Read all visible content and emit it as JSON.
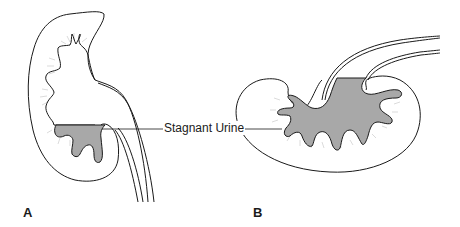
{
  "figure": {
    "type": "medical illustration",
    "callout_label": "Stagnant Urine",
    "panels": [
      {
        "id": "A",
        "label": "A",
        "description": "Kidney in upright orientation; stagnant urine pooled in lower calyces"
      },
      {
        "id": "B",
        "label": "B",
        "description": "Kidney in horizontal orientation; stagnant urine filling most of the pelvis and calyces"
      }
    ],
    "colors": {
      "outline": "#1a1a1a",
      "urine_fill": "#a8a8a8",
      "papilla_hatch": "#b5b5b5",
      "background": "#ffffff"
    }
  }
}
